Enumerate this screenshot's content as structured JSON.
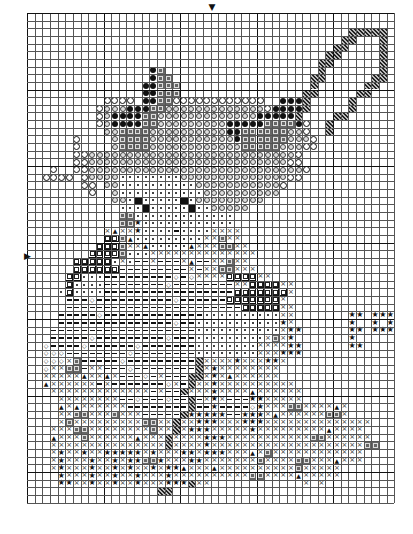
{
  "chart": {
    "origin_px": [
      27,
      13
    ],
    "cell_px": 7.65,
    "cols": 48,
    "rows": 64,
    "major_every": 10,
    "center_markers": {
      "top": {
        "symbol": "▼",
        "col": 24
      },
      "left": {
        "symbol": "▶",
        "row": 32
      }
    },
    "legend": {
      ".": "empty",
      "o": "open-circle",
      "O": "gray-circle",
      "@": "filled-black-circle",
      "d": "dark-square",
      "s": "dot-square",
      "S": "outlined-square",
      "-": "dash",
      "x": "cross",
      "*": "star",
      "^": "triangle",
      "v": "diamond",
      "h": "hatched",
      "n": "black-block"
    },
    "pattern": [
      "................................................",
      "................................................",
      "..........................................hhhhh.",
      ".........................................hh...h.",
      "........................................hh....h.",
      ".......................................hh.....h.",
      "......................................hh......h.",
      "................@d....................h.......h.",
      "................@dd..................hh......hh.",
      "...............@@ddd.................h......hh..",
      "...............@@ddd................hh.....hh...",
      "..........oooo.@@ddoooooooooooo..@@@h.....h.....",
      ".........oOOO@@@ddOOOOOOOOOOOOOo@@@@h.....h.....",
      ".........oO@@@@ddOOOOOOOOOOOOO@@@@@h....hh......",
      ".........oO@@@@ddOOOOOOOOO@@@@@dddd@o..h........",
      "..........OOddddOOOOOOOOOO@@ddddddOOo..h........",
      "......o....OddddOOOOOOOOOOO@ddddddOOOo..........",
      "......o....OddddOOOOOOOOOOOOdddddOOOoo..........",
      "......ooOOOOOOOOOOOOOOOOOOOOOOOOOOOo............",
      "......ooOOOOOOOOOOOOOOOOOOOOOOOOOOoo............",
      "...o..ooOOOOOOOOOOOOOOOOOOOOOOOOOOOOo...........",
      "..oooo.oOOOOssssssssOOOOOOOOOOOOOOoo............",
      ".......oo.OOssssssssssOOOOOOOOOOOo..............",
      "........o..OsssssssssssOOOOOOOOOO...............",
      "...........OOsnsssssnsOOOOOOOOO.................",
      "............sssnsssssnssOOOOO...................",
      "............ddsssssssssssss.....................",
      "............dd*ssssssssssss.....................",
      "..........x^xx*ssss-ssssxxxx....................",
      "..........SSd^sssssssssxxdxx....................",
      ".........SSSdxx^sssss^xxxddxx...................",
      "........SSSSdsssxxxxxxxxxxxxxx..................",
      "......SSSSSsxs--x---x^--xxdxx...................",
      "......SSSSSS---------x-xxddxxx..................",
      ".....SSsss---------v-vxxxxSSSSxx................",
      ".....Sssss--------v--------xxSSSSxx.............",
      "....sSssss-----------------SSSSSSSx.............",
      ".....---v----------v------SSSSSSSx..............",
      ".....-----------------------SSSSSxx.............",
      "....-----v-------------ssssssssssxx.......**.***",
      "....---------------v--sssssssssss*x.......*..*.*",
      "...-------------------sssssssssssx**......**.***",
      "...-----v---------v---sssssssssxdx*.......*.....",
      "..v----v------v-------ssssssssxxxx**......**....",
      "..vvv--------v--------ssssssssxxx***............",
      "..vvvxd-----v---------hxxxx*xxx**x..............",
      "..vxxdd-xx---v--------hx*xxxxxxxx...............",
      "..xxxxx^xx^x---v-x---hhx*x^xxxxxx...............",
      "..^xxxxxx-x-------vx-hxx*xxxxxxxxxx.............",
      "...xxxxxxxxxxxxx-x--hxxx*xxxx^xxxxxx............",
      "....xxxxxxxx--v---v--h-x*x---**xxxxx............",
      "....^x^xxxxxx--------h--*----v*xxxddxxxx^x......",
      "....xxddxxxdxxx-----h*****--***x^xxxxxxddx......",
      "....xdxxxxxxxxxddxxhxx***xxx***xxxxxxxxxxxxxx...",
      "...xxxddxxxxxxxxdxxhx***xxxxx*xxxxxxxxx^xxxx....",
      "...^xxxdxxxxxx^xxxhxxxx***xxxxxxxxxxxddxxxxxx...",
      "...xxxxxxxxxxxxxxxhxxxx*xxxxxxxxxxxxxxxxxxxxdd..",
      "...x*xx*xx*****x*xxx**x***xxx^xdxxxxxxxxxxxx....",
      "...x*xxx*xx*x**dd*xxx**xxxxxxxdxxxxddxxx^xxx....",
      "...x*xxx*xx*x*xx*x**^xxx^xxxxxxxxxxdxxxxx.......",
      "....*xxx*xx*xx*xxx*xxxxxxxxxxddxxxx^xxxxx.......",
      "....**xx*xx*xx*xxx***hxx............x.x.........",
      ".................hh.............................",
      "................................................"
    ]
  }
}
